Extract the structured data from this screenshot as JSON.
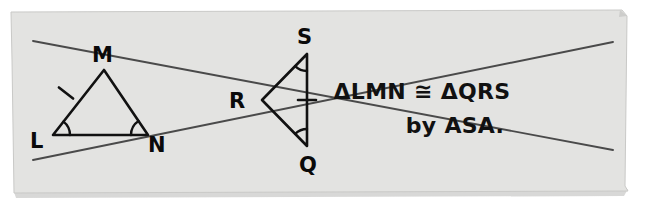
{
  "figure": {
    "paper": {
      "fill_color": "#e3e3e1",
      "edge_color": "#c9c9c7",
      "shadow_color": "#b8b8b6",
      "background_color": "#ffffff",
      "left": 11,
      "top": 10,
      "right": 627,
      "bottom": 190
    },
    "ink_color": "#111111",
    "line_color": "#4a4a4a"
  },
  "triangle_lmn": {
    "name": "triangle-LMN",
    "vertices": [
      {
        "id": "L",
        "label": "L",
        "label_x": 30,
        "label_y": 148,
        "point_x": 53,
        "point_y": 135
      },
      {
        "id": "M",
        "label": "M",
        "label_x": 92,
        "label_y": 62,
        "point_x": 104,
        "point_y": 70
      },
      {
        "id": "N",
        "label": "N",
        "label_x": 148,
        "label_y": 152,
        "point_x": 148,
        "point_y": 135
      }
    ],
    "tick_marks": [
      {
        "side": "LM",
        "count": 1,
        "x": 66,
        "y": 93
      }
    ],
    "angle_arcs": [
      {
        "vertex": "L",
        "count": 1
      },
      {
        "vertex": "N",
        "count": 1
      }
    ]
  },
  "triangle_qrs": {
    "name": "triangle-QRS",
    "vertices": [
      {
        "id": "R",
        "label": "R",
        "label_x": 229,
        "label_y": 108,
        "point_x": 262,
        "point_y": 100
      },
      {
        "id": "S",
        "label": "S",
        "label_x": 297,
        "label_y": 44,
        "point_x": 307,
        "point_y": 54
      },
      {
        "id": "Q",
        "label": "Q",
        "label_x": 299,
        "label_y": 172,
        "point_x": 307,
        "point_y": 146
      }
    ],
    "tick_marks": [
      {
        "side": "SQ",
        "count": 1,
        "x": 307,
        "y": 100
      }
    ],
    "angle_arcs": [
      {
        "vertex": "S",
        "count": 1
      },
      {
        "vertex": "Q",
        "count": 1
      }
    ]
  },
  "transversals": [
    {
      "id": "line-upper",
      "x1": 33,
      "y1": 41,
      "x2": 613,
      "y2": 150
    },
    {
      "id": "line-lower",
      "x1": 33,
      "y1": 160,
      "x2": 613,
      "y2": 42
    }
  ],
  "statement": {
    "line1": "ΔLMN ≅ ΔQRS",
    "line2": "by ASA.",
    "line1_x": 422,
    "line1_y": 99,
    "line2_x": 455,
    "line2_y": 133
  }
}
